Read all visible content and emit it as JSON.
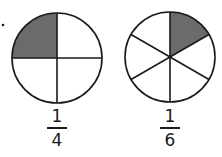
{
  "figures": [
    {
      "name": "circle-fourths",
      "parts": 4,
      "shaded_parts": 1,
      "fraction": {
        "numerator": "1",
        "denominator": "4"
      }
    },
    {
      "name": "circle-sixths",
      "parts": 6,
      "shaded_parts": 1,
      "fraction": {
        "numerator": "1",
        "denominator": "6"
      }
    }
  ],
  "colors": {
    "shade": "#6b6b6b",
    "stroke": "#1a1a1a",
    "background": "#ffffff"
  }
}
